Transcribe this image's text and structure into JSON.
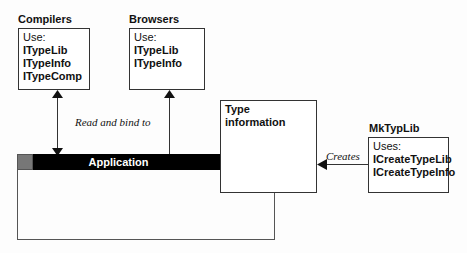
{
  "compilers": {
    "title": "Compilers",
    "use_label": "Use:",
    "items": [
      "ITypeLib",
      "ITypeInfo",
      "ITypeComp"
    ]
  },
  "browsers": {
    "title": "Browsers",
    "use_label": "Use:",
    "items": [
      "ITypeLib",
      "ITypeInfo"
    ]
  },
  "type_information": {
    "title": "Type information"
  },
  "mktyplib": {
    "title": "MkTypLib",
    "use_label": "Uses:",
    "items": [
      "ICreateTypeLib",
      "ICreateTypeInfo"
    ]
  },
  "application": {
    "title": "Application"
  },
  "edges": {
    "read_bind": "Read and bind to",
    "creates": "Creates"
  }
}
